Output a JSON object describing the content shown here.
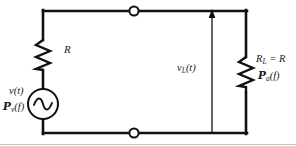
{
  "figure": {
    "kind": "circuit-schematic",
    "background_color": "#ffffff",
    "wire_color": "#111111",
    "text_color": "#1a1a1a",
    "border_color": "#b9b9b9"
  },
  "labels": {
    "series_resistor": "R",
    "source_voltage": "v(t)",
    "source_psd_symbol": "P",
    "source_psd_subscript": "v",
    "source_psd_arg": "(f)",
    "load_voltage_symbol": "v",
    "load_voltage_subscript": "L",
    "load_voltage_arg": "(t)",
    "load_resistor_symbol": "R",
    "load_resistor_subscript": "L",
    "load_resistor_equals": " = R",
    "load_psd_symbol": "P",
    "load_psd_subscript": "a",
    "load_psd_arg": "(f)"
  },
  "components": {
    "source": {
      "name": "ac-voltage-source",
      "type": "ac-source",
      "glyph": "sine-wave"
    },
    "series_resistor": {
      "name": "series-resistor",
      "type": "resistor",
      "glyph": "zigzag"
    },
    "load_resistor": {
      "name": "load-resistor",
      "type": "resistor",
      "glyph": "zigzag"
    },
    "top_terminal": {
      "name": "top-terminal-node",
      "type": "open-terminal"
    },
    "bottom_terminal": {
      "name": "bottom-terminal-node",
      "type": "open-terminal"
    },
    "voltage_arrow": {
      "name": "load-voltage-arrow",
      "type": "arrow",
      "direction": "up"
    }
  }
}
